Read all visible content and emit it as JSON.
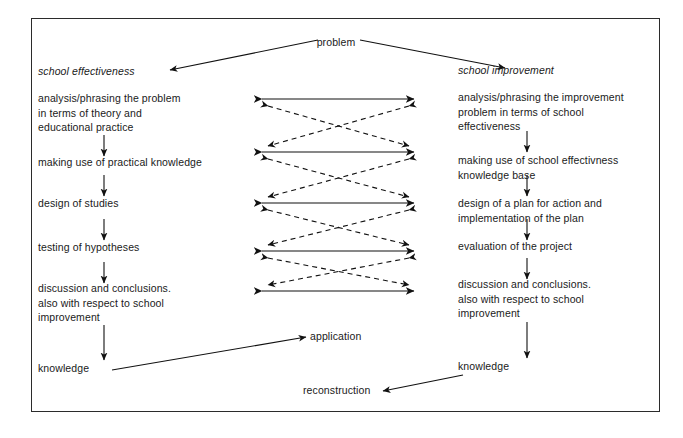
{
  "diagram": {
    "title": "problem",
    "frame": {
      "border_color": "#2b2b2b",
      "background": "#ffffff"
    },
    "top": {
      "problem_label": "problem"
    },
    "columns": {
      "left": {
        "heading": "school effectiveness",
        "steps": [
          "analysis/phrasing the problem\nin terms of theory and\neducational practice",
          "making use of practical knowledge",
          "design of studies",
          "testing of hypotheses",
          "discussion and conclusions.\nalso with respect to school\nimprovement",
          "knowledge"
        ]
      },
      "right": {
        "heading": "school improvement",
        "steps": [
          "analysis/phrasing the improvement\nproblem in terms of school\neffectiveness",
          "making use of school effectivness\nknowledge base",
          "design of a plan for action and\nimplementation of the plan",
          "evaluation of the project",
          "discussion and conclusions.\nalso with respect to school\nimprovement",
          "knowledge"
        ]
      }
    },
    "outcomes": {
      "application": "application",
      "reconstruction": "reconstruction"
    },
    "connector_rows": 5,
    "line_styles": {
      "horizontal": "solid-double-arrow",
      "cross": "dashed-double-arrow"
    }
  }
}
